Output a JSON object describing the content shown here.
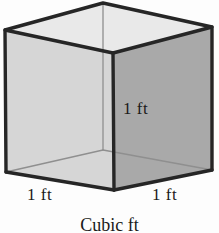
{
  "figure": {
    "type": "cube-diagram",
    "caption": "Cubic ft",
    "background_color": "#fdfdfd",
    "labels": {
      "height": "1 ft",
      "width_left": "1 ft",
      "width_right": "1 ft"
    },
    "faces": {
      "top_color": "#e9e9e9",
      "left_color": "#d6d6d6",
      "right_color": "#a9a9a9",
      "edge_color": "#262626",
      "hidden_edge_color": "#8a8a8a"
    },
    "geometry": {
      "top_back": [
        103,
        3
      ],
      "top_left": [
        5,
        30
      ],
      "top_right": [
        212,
        27
      ],
      "top_front": [
        113,
        53
      ],
      "bottom_left": [
        6,
        172
      ],
      "bottom_right": [
        212,
        170
      ],
      "bottom_front": [
        114,
        190
      ]
    }
  }
}
